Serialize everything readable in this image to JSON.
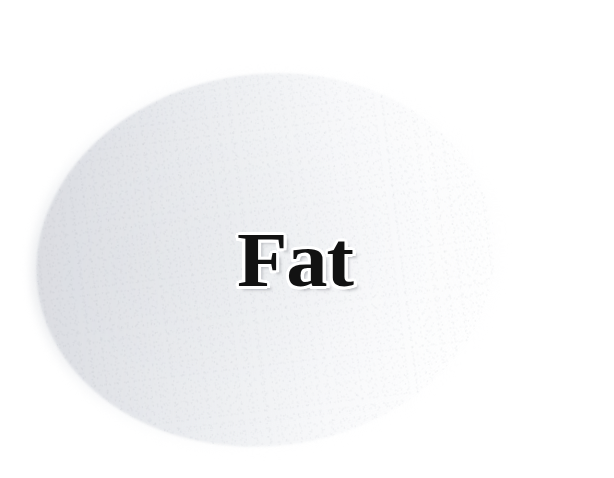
{
  "canvas": {
    "width": 614,
    "height": 478,
    "background_color": "#ffffff"
  },
  "shape": {
    "name": "ellipse",
    "kind": "ellipse",
    "fill_light": "#ffffff",
    "fill_dark": "#d7d9de",
    "gradient_direction": "left-dark-to-right-white",
    "rotation_degrees": -7,
    "bounds": {
      "left": 42,
      "top": 80,
      "right": 492,
      "bottom": 442
    },
    "texture": "paper-grain"
  },
  "label": {
    "text": "Fat",
    "color": "#121212",
    "outline_color": "#ffffff",
    "style": "bold-serif-with-white-outline",
    "position": {
      "left": 243,
      "top": 232,
      "right": 345,
      "bottom": 288
    }
  }
}
